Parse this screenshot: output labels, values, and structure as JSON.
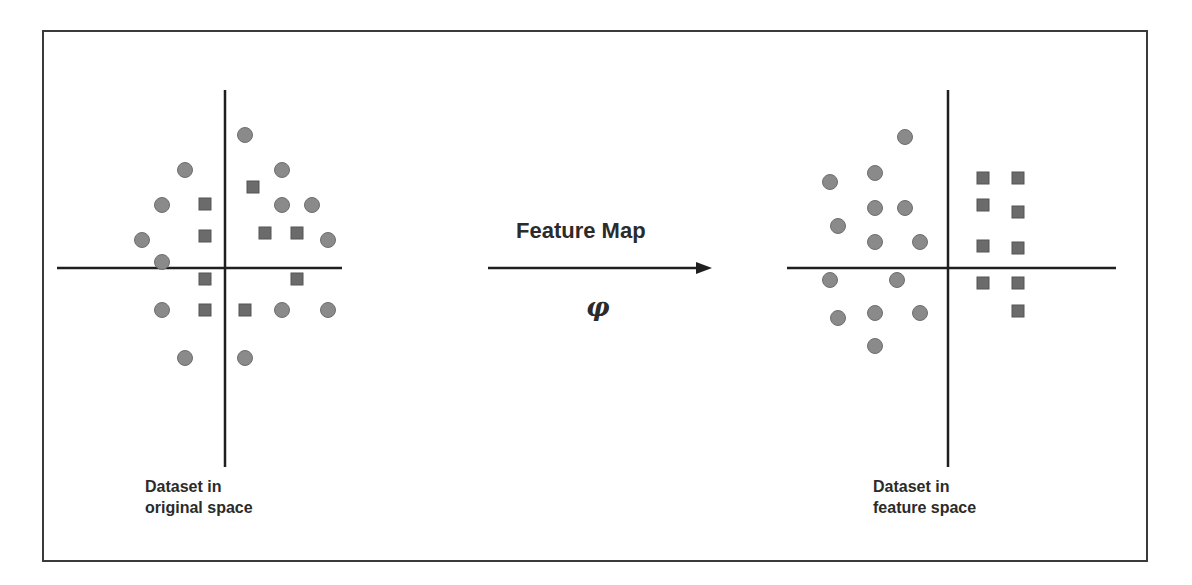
{
  "diagram": {
    "title": "Feature Map",
    "map_symbol": "φ",
    "left_caption_line1": "Dataset in",
    "left_caption_line2": "original space",
    "right_caption_line1": "Dataset in",
    "right_caption_line2": "feature space",
    "colors": {
      "frame": "#3a3a3a",
      "axis": "#1f1f1f",
      "circle_fill": "#8a8a8a",
      "circle_stroke": "#6e6e6e",
      "square_fill": "#6b6b6b",
      "square_stroke": "#555555",
      "text": "#2b2b2b"
    },
    "left_plot": {
      "axes": {
        "vx": 225,
        "vy1": 90,
        "vy2": 467,
        "hy": 268,
        "hx1": 57,
        "hx2": 342
      },
      "circles": [
        [
          245,
          135
        ],
        [
          185,
          170
        ],
        [
          282,
          170
        ],
        [
          162,
          205
        ],
        [
          282,
          205
        ],
        [
          312,
          205
        ],
        [
          142,
          240
        ],
        [
          328,
          240
        ],
        [
          162,
          262
        ],
        [
          162,
          310
        ],
        [
          282,
          310
        ],
        [
          328,
          310
        ],
        [
          185,
          358
        ],
        [
          245,
          358
        ]
      ],
      "squares": [
        [
          253,
          187
        ],
        [
          205,
          204
        ],
        [
          205,
          236
        ],
        [
          265,
          233
        ],
        [
          297,
          233
        ],
        [
          205,
          279
        ],
        [
          297,
          279
        ],
        [
          205,
          310
        ],
        [
          245,
          310
        ]
      ]
    },
    "right_plot": {
      "axes": {
        "vx": 948,
        "vy1": 90,
        "vy2": 467,
        "hy": 268,
        "hx1": 787,
        "hx2": 1116
      },
      "circles": [
        [
          905,
          137
        ],
        [
          875,
          173
        ],
        [
          830,
          182
        ],
        [
          875,
          208
        ],
        [
          905,
          208
        ],
        [
          838,
          226
        ],
        [
          875,
          242
        ],
        [
          920,
          242
        ],
        [
          830,
          280
        ],
        [
          897,
          280
        ],
        [
          838,
          318
        ],
        [
          875,
          313
        ],
        [
          920,
          313
        ],
        [
          875,
          346
        ]
      ],
      "squares": [
        [
          983,
          178
        ],
        [
          1018,
          178
        ],
        [
          983,
          205
        ],
        [
          1018,
          212
        ],
        [
          983,
          246
        ],
        [
          1018,
          248
        ],
        [
          983,
          283
        ],
        [
          1018,
          283
        ],
        [
          1018,
          311
        ]
      ]
    },
    "arrow": {
      "x1": 488,
      "x2": 712,
      "y": 268
    }
  }
}
